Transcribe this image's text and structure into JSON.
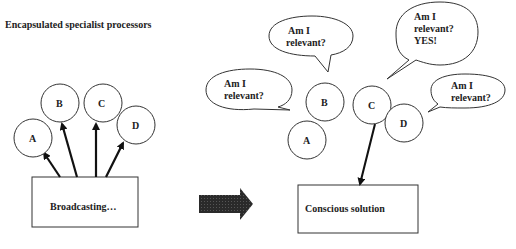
{
  "title": "Encapsulated specialist processors",
  "left": {
    "processors": [
      {
        "label": "A",
        "cx": 33,
        "cy": 138
      },
      {
        "label": "B",
        "cx": 60,
        "cy": 103
      },
      {
        "label": "C",
        "cx": 103,
        "cy": 103
      },
      {
        "label": "D",
        "cx": 136,
        "cy": 125
      }
    ],
    "box_label": "Broadcasting…"
  },
  "transition_arrow": "right-arrow",
  "right": {
    "processors": [
      {
        "label": "A",
        "cx": 307,
        "cy": 140
      },
      {
        "label": "B",
        "cx": 325,
        "cy": 102
      },
      {
        "label": "C",
        "cx": 372,
        "cy": 105
      },
      {
        "label": "D",
        "cx": 404,
        "cy": 123
      }
    ],
    "bubbles": {
      "a": {
        "line1": "Am I",
        "line2": "relevant?"
      },
      "b": {
        "line1": "Am I",
        "line2": "relevant?"
      },
      "c": {
        "line1": "Am I",
        "line2": "relevant?",
        "line3": "YES!"
      },
      "d": {
        "line1": "Am I",
        "line2": "relevant?"
      }
    },
    "box_label": "Conscious solution"
  }
}
